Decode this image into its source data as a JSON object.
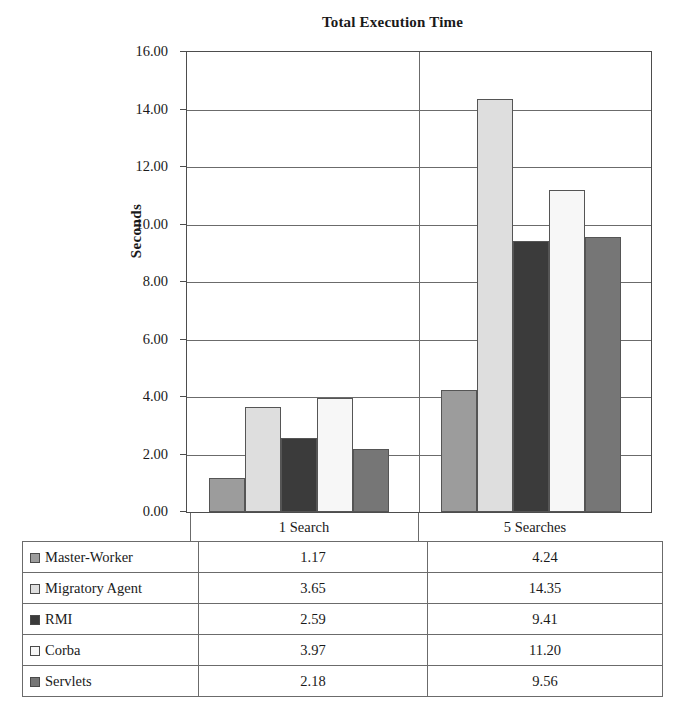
{
  "chart_data": {
    "type": "bar",
    "title": "Total Execution Time",
    "xlabel": "",
    "ylabel": "Seconds",
    "ylim": [
      0,
      16
    ],
    "ytick_step": 2,
    "ytick_labels": [
      "16.00",
      "14.00",
      "12.00",
      "10.00",
      "8.00",
      "6.00",
      "4.00",
      "2.00",
      "0.00"
    ],
    "ytick_values": [
      16,
      14,
      12,
      10,
      8,
      6,
      4,
      2,
      0
    ],
    "grid": true,
    "legend_position": "data-table",
    "categories": [
      "1 Search",
      "5 Searches"
    ],
    "series": [
      {
        "name": "Master-Worker",
        "values": [
          1.17,
          4.24
        ],
        "color": "#9c9c9c"
      },
      {
        "name": "Migratory Agent",
        "values": [
          3.65,
          14.35
        ],
        "color": "#dedede"
      },
      {
        "name": "RMI",
        "values": [
          2.59,
          9.41
        ],
        "color": "#3b3b3b"
      },
      {
        "name": "Corba",
        "values": [
          3.97,
          11.2
        ],
        "color": "#f7f7f7"
      },
      {
        "name": "Servlets",
        "values": [
          2.18,
          9.56
        ],
        "color": "#767676"
      }
    ]
  },
  "table": {
    "columns": [
      "",
      "1 Search",
      "5 Searches"
    ],
    "rows": [
      {
        "label": "Master-Worker",
        "values": [
          "1.17",
          "4.24"
        ]
      },
      {
        "label": "Migratory Agent",
        "values": [
          "3.65",
          "14.35"
        ]
      },
      {
        "label": "RMI",
        "values": [
          "2.59",
          "9.41"
        ]
      },
      {
        "label": "Corba",
        "values": [
          "3.97",
          "11.20"
        ]
      },
      {
        "label": "Servlets",
        "values": [
          "2.18",
          "9.56"
        ]
      }
    ]
  }
}
